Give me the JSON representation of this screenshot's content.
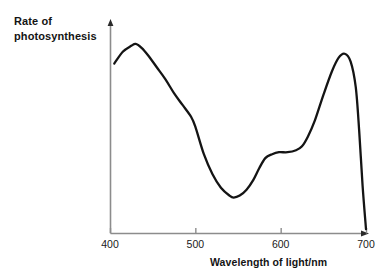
{
  "figure": {
    "background_color": "#ffffff",
    "axis_color": "#8c8c8c",
    "curve_color": "#141414"
  },
  "labels": {
    "y_axis_title": "Rate of\nphotosynthesis",
    "x_axis_title": "Wavelength of light/nm"
  },
  "ticks": {
    "x": [
      {
        "value": 400,
        "label": "400",
        "px": 110
      },
      {
        "value": 500,
        "label": "500",
        "px": 195
      },
      {
        "value": 600,
        "label": "600",
        "px": 281
      },
      {
        "value": 700,
        "label": "700",
        "px": 366
      }
    ]
  },
  "chart_data": {
    "type": "line",
    "title": "",
    "subtitle": "",
    "xlabel": "Wavelength of light/nm",
    "ylabel": "Rate of photosynthesis",
    "xlim": [
      400,
      700
    ],
    "ylim": [
      0,
      100
    ],
    "xticks": [
      400,
      500,
      600,
      700
    ],
    "yticks": [],
    "grid": false,
    "legend": null,
    "annotations": [],
    "series": [
      {
        "name": "Rate of photosynthesis (action spectrum)",
        "color": "#141414",
        "x": [
          405,
          415,
          425,
          430,
          437,
          445,
          455,
          465,
          475,
          485,
          495,
          500,
          510,
          520,
          530,
          540,
          545,
          552,
          560,
          568,
          575,
          582,
          590,
          598,
          608,
          618,
          625,
          632,
          640,
          650,
          660,
          668,
          675,
          682,
          688,
          692,
          696,
          700
        ],
        "y": [
          86,
          92,
          95,
          96,
          94,
          90,
          84,
          78,
          71,
          65,
          59,
          54,
          40,
          30,
          23,
          19,
          18,
          19,
          22,
          27,
          33,
          38,
          40,
          41,
          41,
          42,
          44,
          49,
          57,
          70,
          82,
          89,
          91,
          87,
          74,
          52,
          24,
          2
        ]
      }
    ],
    "features": {
      "blue_peak_nm": 430,
      "blue_peak_value": 96,
      "green_trough_nm": 545,
      "green_trough_value": 18,
      "orange_shoulder_nm": 610,
      "orange_shoulder_value": 41,
      "red_peak_nm": 675,
      "red_peak_value": 91,
      "cutoff_nm": 700,
      "cutoff_value": 2
    }
  }
}
